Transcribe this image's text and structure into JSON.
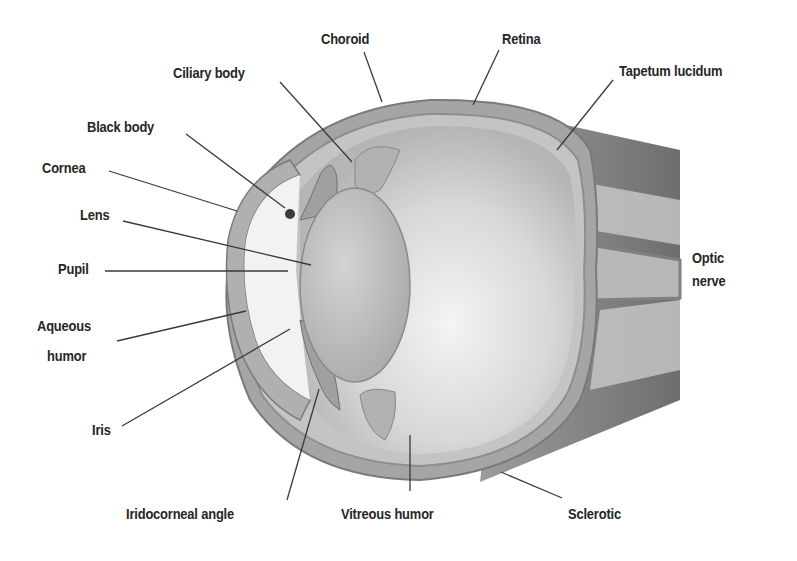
{
  "diagram": {
    "title": "",
    "labels": {
      "choroid": "Choroid",
      "retina": "Retina",
      "ciliary_body": "Ciliary body",
      "tapetum_lucidum": "Tapetum  lucidum",
      "black_body": "Black body",
      "cornea": "Cornea",
      "lens": "Lens",
      "pupil": "Pupil",
      "optic_nerve_1": "Optic",
      "optic_nerve_2": "nerve",
      "aqueous_humor_1": "Aqueous",
      "aqueous_humor_2": "humor",
      "iris": "Iris",
      "iridocorneal_angle": "Iridocorneal angle",
      "vitreous_humor": "Vitreous humor",
      "sclerotic": "Sclerotic"
    },
    "colors": {
      "background": "#ffffff",
      "text": "#262626",
      "leader_line": "#3a3a3a",
      "sclera": "#9a9a9a",
      "vitreous": "#d9d9d9",
      "lens": "#bdbdbd"
    }
  }
}
